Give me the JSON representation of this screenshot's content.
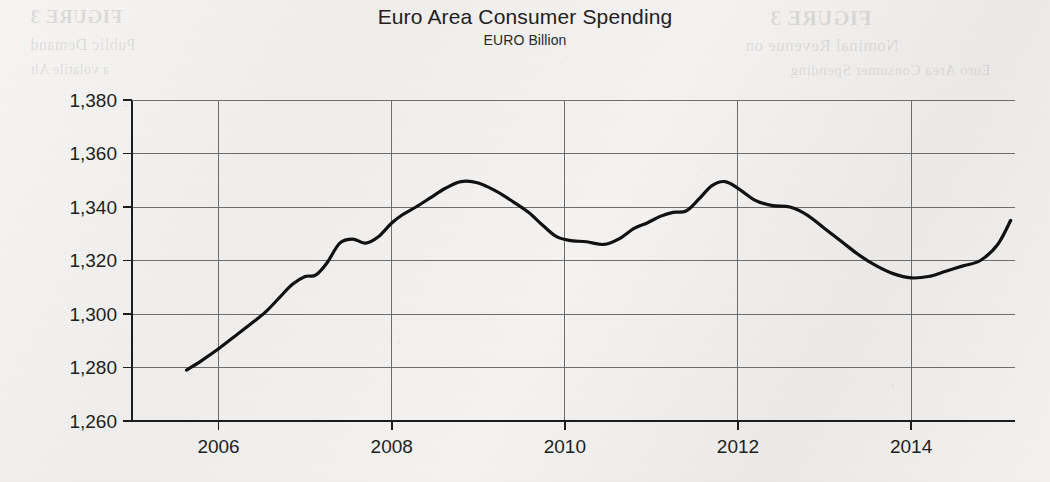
{
  "chart_data": {
    "type": "line",
    "title": "Euro Area Consumer Spending",
    "subtitle": "EURO Billion",
    "xlabel": "",
    "ylabel": "EURO Billion",
    "xlim": [
      2005.0,
      2015.2
    ],
    "ylim": [
      1260,
      1380
    ],
    "y_ticks": [
      1260,
      1280,
      1300,
      1320,
      1340,
      1360,
      1380
    ],
    "y_tick_labels": [
      "1,260",
      "1,280",
      "1,300",
      "1,320",
      "1,340",
      "1,360",
      "1,380"
    ],
    "x_ticks": [
      2006,
      2008,
      2010,
      2012,
      2014
    ],
    "x_tick_labels": [
      "2006",
      "2008",
      "2010",
      "2012",
      "2014"
    ],
    "grid": true,
    "legend": "none",
    "line_color": "#111111",
    "series": [
      {
        "name": "Euro Area Consumer Spending",
        "x": [
          2005.63,
          2005.8,
          2006.0,
          2006.2,
          2006.4,
          2006.55,
          2006.7,
          2006.85,
          2007.0,
          2007.12,
          2007.25,
          2007.4,
          2007.55,
          2007.7,
          2007.85,
          2008.0,
          2008.12,
          2008.28,
          2008.45,
          2008.62,
          2008.8,
          2009.0,
          2009.2,
          2009.4,
          2009.58,
          2009.75,
          2009.9,
          2010.05,
          2010.25,
          2010.45,
          2010.62,
          2010.8,
          2010.95,
          2011.1,
          2011.25,
          2011.4,
          2011.55,
          2011.7,
          2011.85,
          2012.0,
          2012.2,
          2012.4,
          2012.6,
          2012.8,
          2013.0,
          2013.2,
          2013.4,
          2013.6,
          2013.8,
          2014.0,
          2014.2,
          2014.4,
          2014.6,
          2014.8,
          2015.0,
          2015.15
        ],
        "y": [
          1279.0,
          1282.5,
          1287.0,
          1292.0,
          1297.0,
          1301.0,
          1306.0,
          1311.0,
          1314.0,
          1314.5,
          1319.0,
          1326.5,
          1328.0,
          1326.5,
          1329.0,
          1334.0,
          1337.0,
          1340.0,
          1343.5,
          1347.0,
          1349.5,
          1349.0,
          1346.0,
          1342.0,
          1338.0,
          1333.0,
          1329.0,
          1327.5,
          1327.0,
          1326.0,
          1328.0,
          1332.0,
          1334.0,
          1336.5,
          1338.0,
          1338.5,
          1343.0,
          1348.0,
          1349.5,
          1347.0,
          1342.5,
          1340.5,
          1340.0,
          1337.0,
          1332.0,
          1327.0,
          1322.0,
          1318.0,
          1315.0,
          1313.5,
          1314.0,
          1316.0,
          1318.0,
          1320.0,
          1326.0,
          1335.0
        ]
      }
    ],
    "annotations": {
      "start_value": 1279,
      "end_value": 1350,
      "peak_2008": 1350,
      "peak_2011": 1350,
      "trough_2013": 1313.5
    }
  },
  "background_bleed": {
    "line_1": "FIGURE 3",
    "line_2": "Public Demand",
    "line_3": "a volatile Alt",
    "line_4": "FIGURE 3",
    "line_5": "Nominal Revenue on",
    "line_6": "Euro Area Consumer Spending"
  }
}
